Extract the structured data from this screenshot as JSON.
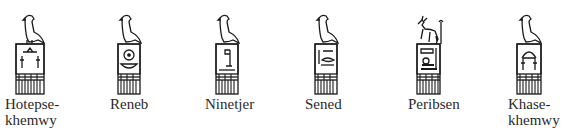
{
  "figure": {
    "colors": {
      "ink": "#1a1a1a",
      "background": "#ffffff"
    },
    "kings": [
      {
        "name": "Hotepsekhemwy",
        "label": "Hotepse-\nkhemwy",
        "surmount": "falcon",
        "x": 5
      },
      {
        "name": "Reneb",
        "label": "Reneb",
        "surmount": "falcon",
        "x": 110
      },
      {
        "name": "Ninetjer",
        "label": "Ninetjer",
        "surmount": "falcon",
        "x": 205
      },
      {
        "name": "Sened",
        "label": "Sened",
        "surmount": "falcon",
        "x": 305
      },
      {
        "name": "Peribsen",
        "label": "Peribsen",
        "surmount": "seth-animal",
        "x": 408
      },
      {
        "name": "Khasekhemwy",
        "label": "Khase-\nkhemwy",
        "surmount": "falcon",
        "x": 508
      }
    ]
  }
}
